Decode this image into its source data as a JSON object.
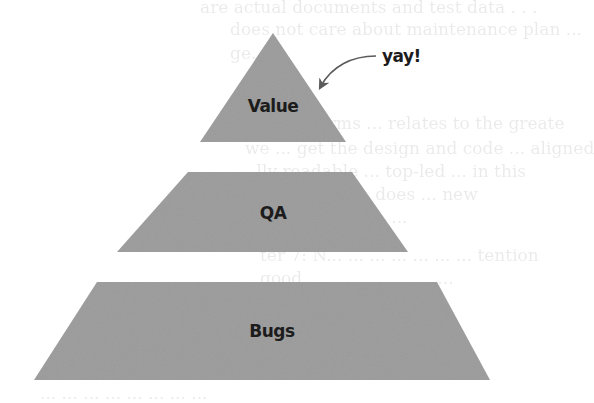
{
  "diagram": {
    "type": "pyramid",
    "fill_color": "#9a9a9a",
    "text_color": "#1c1c1c",
    "tiers": [
      {
        "label": "Value",
        "shape": "triangle",
        "position": "top"
      },
      {
        "label": "QA",
        "shape": "trapezoid",
        "position": "middle"
      },
      {
        "label": "Bugs",
        "shape": "trapezoid",
        "position": "bottom"
      }
    ],
    "annotation": {
      "text": "yay!",
      "points_to": "Value",
      "arrow": "curved-arrow"
    }
  },
  "background_bleed_text": [
    "are actual documents and test data . . .",
    "does not care about maintenance plan ...",
    "ge.",
    "r A ... Terms ... relates to the greate",
    "we ... get the design and code ... aligned",
    "... lly readable ... top-led ... in this",
    "... a ... ... ... ... ... does ... new",
    "... ... ... ... ... ... ... ...",
    "ter 7: N... ... ... ... ... ... ... tention",
    "good ... ... ... ... ... ... ...",
    "... ... ... ... ... ... ... ... ...",
    "... ... ... ... ... ... ... ..."
  ]
}
